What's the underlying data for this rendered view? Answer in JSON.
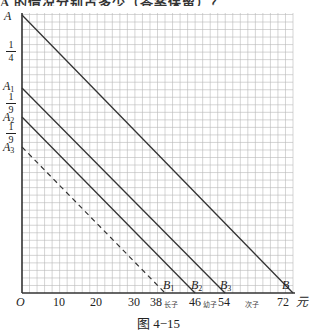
{
  "header": {
    "partial_text": "A 的情况分别占多少（答案保留）？"
  },
  "axes": {
    "origin_label": "O",
    "x_unit": "元",
    "x_ticks": [
      "10",
      "20",
      "30",
      "38",
      "46",
      "54",
      "72"
    ],
    "x_tags": {
      "38": "长子",
      "46": "幼子",
      "54": "次子"
    },
    "y_points": [
      "A",
      "A1",
      "A2",
      "A3"
    ],
    "y_fractions": [
      {
        "num": "1",
        "den": "4"
      },
      {
        "num": "1",
        "den": "9"
      },
      {
        "num": "1",
        "den": "9"
      }
    ]
  },
  "point_labels": {
    "A": "A",
    "A1_base": "A",
    "A1_sub": "1",
    "A2_base": "A",
    "A2_sub": "2",
    "A3_base": "A",
    "A3_sub": "3",
    "B": "B",
    "B1_base": "B",
    "B1_sub": "1",
    "B2_base": "B",
    "B2_sub": "2",
    "B3_base": "B",
    "B3_sub": "3"
  },
  "chart_data": {
    "type": "line",
    "title": "",
    "caption": "图 4−15",
    "xlabel": "元",
    "ylabel": "",
    "xlim": [
      0,
      72
    ],
    "grid": true,
    "series": [
      {
        "name": "AB",
        "from": "A",
        "to": "B",
        "x_end": 72,
        "style": "solid"
      },
      {
        "name": "A1B3",
        "from": "A1",
        "to": "B3",
        "x_end": 54,
        "style": "solid"
      },
      {
        "name": "A2B2",
        "from": "A2",
        "to": "B2",
        "x_end": 46,
        "style": "solid"
      },
      {
        "name": "A3B1",
        "from": "A3",
        "to": "B1",
        "x_end": 38,
        "style": "dashed"
      }
    ],
    "annotations": [
      "A→A1: 1/4",
      "A1→A2: 1/9",
      "A2→A3: 1/9",
      "38 长子",
      "46 幼子",
      "54 次子"
    ]
  },
  "caption": "图 4−15"
}
